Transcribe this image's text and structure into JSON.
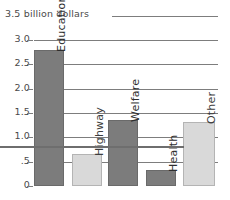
{
  "caption": "3.5 billion dollars",
  "colors": {
    "dark_bar": "#7c7c7c",
    "light_bar": "#d9d9d9",
    "gridline": "#7d7d7d",
    "text": "#4a4a4a",
    "background": "#ffffff"
  },
  "axis": {
    "ticks": [
      "3.0",
      "2.5",
      "2.0",
      "1.5",
      "1.0",
      ".5",
      "0"
    ],
    "tick_values": [
      3.0,
      2.5,
      2.0,
      1.5,
      1.0,
      0.5,
      0
    ]
  },
  "chart_data": {
    "type": "bar",
    "title": "3.5 billion dollars",
    "xlabel": "",
    "ylabel": "billion dollars",
    "ylim": [
      0,
      3.0
    ],
    "yticks": [
      0,
      0.5,
      1.0,
      1.5,
      2.0,
      2.5,
      3.0
    ],
    "ytick_labels": [
      "0",
      ".5",
      "1.0",
      "1.5",
      "2.0",
      "2.5",
      "3.0"
    ],
    "grid": true,
    "legend": "none",
    "categories": [
      "Education",
      "Highway",
      "Welfare",
      "Health",
      "Other"
    ],
    "values": [
      2.8,
      0.65,
      1.35,
      0.33,
      1.31
    ],
    "bar_colors": [
      "#7c7c7c",
      "#d9d9d9",
      "#7c7c7c",
      "#7c7c7c",
      "#d9d9d9"
    ],
    "bar_shades": [
      "dark",
      "light",
      "dark",
      "dark",
      "light"
    ]
  },
  "bars": [
    {
      "label": "Education",
      "value": 2.8,
      "shade": "dark",
      "left": 0,
      "width": 30
    },
    {
      "label": "Highway",
      "value": 0.65,
      "shade": "light",
      "left": 38,
      "width": 30
    },
    {
      "label": "Welfare",
      "value": 1.35,
      "shade": "dark",
      "left": 74,
      "width": 30
    },
    {
      "label": "Health",
      "value": 0.33,
      "shade": "dark",
      "left": 112,
      "width": 30
    },
    {
      "label": "Other",
      "value": 1.31,
      "shade": "light",
      "left": 149,
      "width": 32
    }
  ]
}
